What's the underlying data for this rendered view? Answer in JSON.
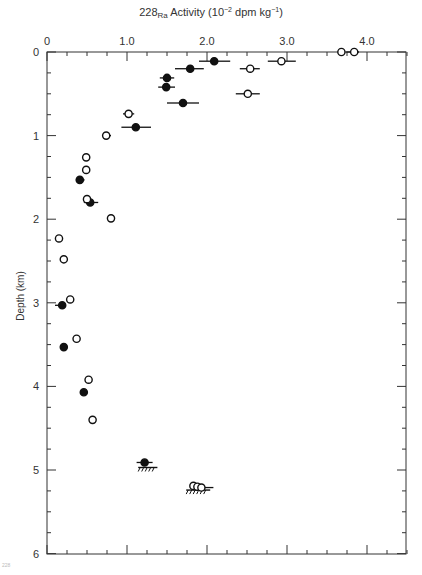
{
  "chart_data": {
    "type": "scatter",
    "title_parts": {
      "prefix": "228",
      "sub": "Ra",
      "mid": " Activity (10",
      "sup1": "−2",
      "mid2": " dpm kg",
      "sup2": "−1",
      "suffix": ")"
    },
    "xlabel": "228Ra Activity (10^-2 dpm kg^-1)",
    "ylabel": "Depth (km)",
    "x_axis_position": "top",
    "y_inverted": true,
    "xlim": [
      0,
      4.5
    ],
    "ylim": [
      0,
      6
    ],
    "x_ticks": [
      0,
      1.0,
      2.0,
      3.0,
      4.0
    ],
    "x_tick_labels": [
      "0",
      "1.0",
      "2.0",
      "3.0",
      "4.0"
    ],
    "y_ticks": [
      0,
      1,
      2,
      3,
      4,
      5,
      6
    ],
    "y_tick_labels": [
      "0",
      "1",
      "2",
      "3",
      "4",
      "5",
      "6"
    ],
    "grid": false,
    "legend": null,
    "series": [
      {
        "name": "filled",
        "marker": "filled-circle",
        "points": [
          {
            "x": 2.09,
            "y": 0.11,
            "xerr": [
              1.9,
              2.29
            ]
          },
          {
            "x": 1.79,
            "y": 0.2,
            "xerr": [
              1.6,
              1.96
            ]
          },
          {
            "x": 1.5,
            "y": 0.31,
            "xerr": [
              1.41,
              1.59
            ]
          },
          {
            "x": 1.49,
            "y": 0.42,
            "xerr": [
              1.39,
              1.6
            ]
          },
          {
            "x": 1.7,
            "y": 0.61,
            "xerr": [
              1.5,
              1.9
            ]
          },
          {
            "x": 1.11,
            "y": 0.9,
            "xerr": [
              0.93,
              1.3
            ]
          },
          {
            "x": 0.41,
            "y": 1.53,
            "xerr": [
              0.36,
              0.47
            ]
          },
          {
            "x": 0.54,
            "y": 1.8,
            "xerr": [
              0.46,
              0.64
            ]
          },
          {
            "x": 0.19,
            "y": 3.03,
            "xerr": [
              0.1,
              0.19
            ]
          },
          {
            "x": 0.21,
            "y": 3.53,
            "xerr": null
          },
          {
            "x": 0.46,
            "y": 4.07,
            "xerr": [
              0.42,
              0.51
            ]
          },
          {
            "x": 1.22,
            "y": 4.91,
            "xerr": [
              1.12,
              1.32
            ]
          }
        ]
      },
      {
        "name": "open",
        "marker": "open-circle",
        "points": [
          {
            "x": 3.68,
            "y": 0.0,
            "xerr": null
          },
          {
            "x": 3.84,
            "y": 0.0,
            "xerr": [
              3.74,
              3.9
            ]
          },
          {
            "x": 2.93,
            "y": 0.11,
            "xerr": [
              2.76,
              3.11
            ]
          },
          {
            "x": 2.54,
            "y": 0.2,
            "xerr": [
              2.41,
              2.66
            ]
          },
          {
            "x": 2.51,
            "y": 0.5,
            "xerr": [
              2.36,
              2.66
            ]
          },
          {
            "x": 1.02,
            "y": 0.74,
            "xerr": [
              0.95,
              1.09
            ]
          },
          {
            "x": 0.74,
            "y": 1.0,
            "xerr": [
              0.69,
              0.8
            ]
          },
          {
            "x": 0.49,
            "y": 1.26,
            "xerr": null
          },
          {
            "x": 0.49,
            "y": 1.41,
            "xerr": null
          },
          {
            "x": 0.5,
            "y": 1.76,
            "xerr": null
          },
          {
            "x": 0.8,
            "y": 1.99,
            "xerr": null
          },
          {
            "x": 0.15,
            "y": 2.23,
            "xerr": null
          },
          {
            "x": 0.21,
            "y": 2.48,
            "xerr": null
          },
          {
            "x": 0.29,
            "y": 2.96,
            "xerr": null
          },
          {
            "x": 0.37,
            "y": 3.43,
            "xerr": null
          },
          {
            "x": 0.52,
            "y": 3.92,
            "xerr": null
          },
          {
            "x": 0.57,
            "y": 4.4,
            "xerr": null
          },
          {
            "x": 1.83,
            "y": 5.19,
            "xerr": null
          },
          {
            "x": 1.88,
            "y": 5.2,
            "xerr": null
          },
          {
            "x": 1.93,
            "y": 5.21,
            "xerr": [
              1.8,
              2.08
            ]
          }
        ]
      }
    ],
    "annotations": [
      {
        "type": "seafloor-hatch",
        "x_range": [
          1.14,
          1.38
        ],
        "y": 4.97
      },
      {
        "type": "seafloor-hatch",
        "x_range": [
          1.74,
          2.04
        ],
        "y": 5.24
      }
    ]
  },
  "labels": {
    "ylabel": "Depth (km)",
    "footnote": "228"
  }
}
